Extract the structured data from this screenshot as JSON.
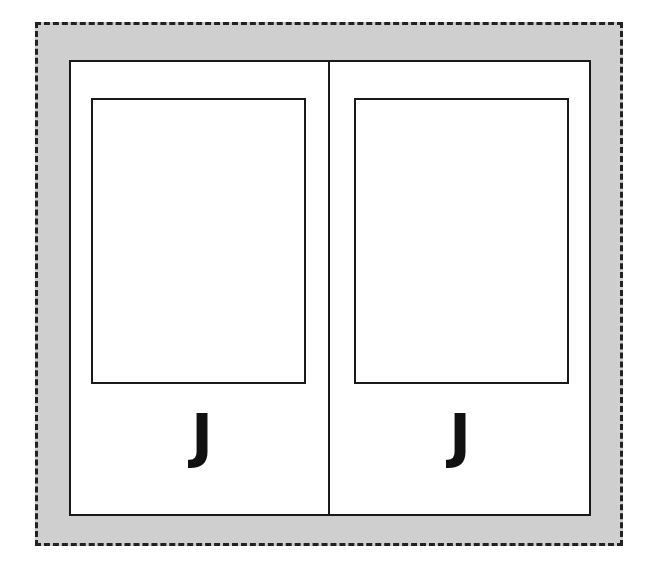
{
  "diagram": {
    "panels": [
      {
        "letter": "J"
      },
      {
        "letter": "J"
      }
    ],
    "colors": {
      "background": "#cfcfcf",
      "panel": "#ffffff",
      "stroke": "#1a1a1a"
    }
  }
}
